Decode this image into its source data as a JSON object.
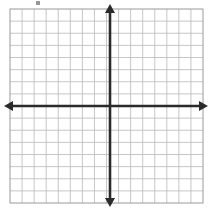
{
  "figure": {
    "kind": "coordinate-plane",
    "title": "",
    "background_color": "#ffffff",
    "width": 212,
    "height": 211,
    "artifact_label": ""
  },
  "grid": {
    "columns": 16,
    "rows": 16,
    "left": 10,
    "top": 9,
    "right": 203,
    "bottom": 203,
    "cell_width": 12.06,
    "cell_height": 12.13,
    "line_color": "#b9b9b9",
    "border_color": "#9a9a9a",
    "line_width": 0.8,
    "show_grid": true
  },
  "axes": {
    "color": "#2b2b2b",
    "line_width": 2.6,
    "origin_x": 110,
    "origin_y": 106,
    "x_axis": {
      "label": "",
      "left_end": 4,
      "right_end": 208,
      "arrow_left": true,
      "arrow_right": true
    },
    "y_axis": {
      "label": "",
      "top_end": 4,
      "bottom_end": 207,
      "arrow_up": true,
      "arrow_down": true
    },
    "tick_labels_visible": false,
    "x_tick_labels": [],
    "y_tick_labels": []
  },
  "chart_data": {
    "type": "scatter",
    "title": "",
    "subtitle": "",
    "xlabel": "",
    "ylabel": "",
    "xlim": [
      -8,
      8
    ],
    "ylim": [
      -8,
      8
    ],
    "xticks": [
      -8,
      -7,
      -6,
      -5,
      -4,
      -3,
      -2,
      -1,
      0,
      1,
      2,
      3,
      4,
      5,
      6,
      7,
      8
    ],
    "yticks": [
      -8,
      -7,
      -6,
      -5,
      -4,
      -3,
      -2,
      -1,
      0,
      1,
      2,
      3,
      4,
      5,
      6,
      7,
      8
    ],
    "xtick_labels": [],
    "ytick_labels": [],
    "grid": true,
    "legend": null,
    "annotations": [],
    "series": [
      {
        "name": "",
        "x": [],
        "y": []
      }
    ],
    "note": "Empty 16x16 blank coordinate plane; axes intersect at the grid center (origin). No plotted data points, no numeric tick labels, no legend."
  }
}
